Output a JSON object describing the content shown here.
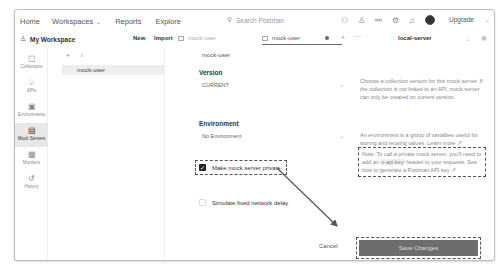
{
  "topbar": {
    "nav": [
      "Home",
      "Workspaces",
      "Reports",
      "Explore"
    ],
    "search_placeholder": "Search Postman",
    "upgrade_label": "Upgrade"
  },
  "toolbar": {
    "workspace": "My Workspace",
    "new_label": "New",
    "import_label": "Import",
    "tabs": [
      {
        "label": "mock-user"
      },
      {
        "label": "mock-user"
      }
    ],
    "environment": "local-server"
  },
  "sidebar": {
    "items": [
      {
        "label": "Collections",
        "icon": "collections-icon"
      },
      {
        "label": "APIs",
        "icon": "apis-icon"
      },
      {
        "label": "Environments",
        "icon": "environments-icon"
      },
      {
        "label": "Mock Servers",
        "icon": "mock-servers-icon",
        "active": true
      },
      {
        "label": "Monitors",
        "icon": "monitors-icon"
      },
      {
        "label": "History",
        "icon": "history-icon"
      }
    ]
  },
  "list": {
    "items": [
      "mock-user"
    ]
  },
  "form": {
    "name": "mock-user",
    "version_label": "Version",
    "version_value": "CURRENT",
    "version_help": "Choose a collection version for this mock server. If the collection is not linked to an API, mock server can only be created on current version.",
    "environment_label": "Environment",
    "environment_value": "No Environment",
    "environment_help": "An environment is a group of variables useful for storing and reusing values. Learn more ↗",
    "private_label": "Make mock server private",
    "private_checked": true,
    "note_prefix": "Note: To call a private mock server, you'll need to add an",
    "note_code": "x-api-key",
    "note_suffix": "header to your requests. See how to generate a Postman API key ↗",
    "delay_label": "Simulate fixed network delay",
    "delay_checked": false,
    "cancel_label": "Cancel",
    "save_label": "Save Changes"
  }
}
